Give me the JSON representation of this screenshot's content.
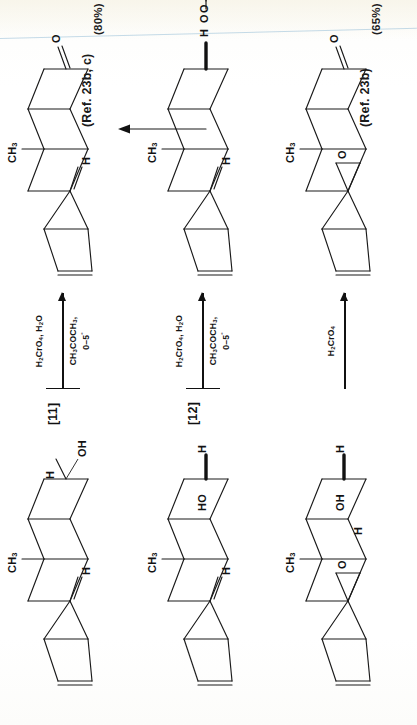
{
  "document": {
    "kind": "chemical-reaction-scheme",
    "orientation": "rotated-90-ccw",
    "page_background": "#ffffff",
    "ink_color": "#1a1a1a"
  },
  "references": [
    {
      "id": "ref-top",
      "text": "(Ref. 23b, c)"
    },
    {
      "id": "ref-bottom",
      "text": "(Ref. 23b)"
    }
  ],
  "reactions": [
    {
      "id": "reaction-1",
      "substrate_label": "[11]",
      "substrate_groups": {
        "methyl": "CH3",
        "hydrogen_top": "H",
        "hydroxyl": "OH",
        "hydrogen_left": "H"
      },
      "reagent_above": "H2CrO4, H2O",
      "reagent_below_line1": "CH3COCH3,",
      "reagent_below_line2": "0–5°",
      "product_groups": {
        "methyl": "CH3",
        "hydrogen": "H",
        "ketone_oxygen": "O"
      },
      "yield": "(80%)"
    },
    {
      "id": "reaction-2",
      "substrate_label": "[12]",
      "substrate_groups": {
        "methyl": "CH3",
        "hydrogen_top": "H",
        "hydroxyl": "HO",
        "hydrogen_right": "H"
      },
      "reagent_above": "H2CrO4, H2O",
      "reagent_below_line1": "CH3COCH3,",
      "reagent_below_line2": "0–5°",
      "product_groups": {
        "methyl": "CH3",
        "hydrogen_top": "H",
        "hydrogen_lower": "H",
        "ester_oxygen": "O"
      },
      "chromate_ester": {
        "double_bond_o_top": "O",
        "double_bond_o_left": "O",
        "hydroxy": "HO",
        "metal": "Cr",
        "link_oxygen": "O"
      },
      "yield": null
    },
    {
      "id": "reaction-3",
      "substrate_label": null,
      "substrate_groups": {
        "methyl": "CH3",
        "hydroxyl": "OH",
        "hydrogen_right": "H",
        "hydrogen_epoxide": "H",
        "epoxide_oxygen": "O"
      },
      "reagent_above": "H2CrO4",
      "reagent_below_line1": null,
      "reagent_below_line2": null,
      "product_groups": {
        "methyl": "CH3",
        "epoxide_oxygen": "O",
        "ketone_oxygen": "O"
      },
      "yield": "(65%)"
    }
  ],
  "connector": {
    "id": "vertical-arrow",
    "description": "arrow pointing up from reaction-2 chromate ester toward reaction-1 product"
  },
  "atoms": {
    "CH3": "CH",
    "CH3_sub": "3",
    "H": "H",
    "OH": "OH",
    "HO": "HO",
    "O": "O",
    "Cr": "Cr"
  }
}
